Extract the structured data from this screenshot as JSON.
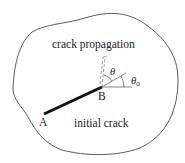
{
  "diagram": {
    "labels": {
      "propagation": "crack propagation",
      "initial": "initial crack",
      "point_a": "A",
      "point_b": "B",
      "theta": "θ",
      "theta0_base": "θ",
      "theta0_sub": "0"
    },
    "colors": {
      "stroke": "#333333",
      "crack": "#111111",
      "text": "#222222",
      "background": "#ffffff"
    }
  }
}
